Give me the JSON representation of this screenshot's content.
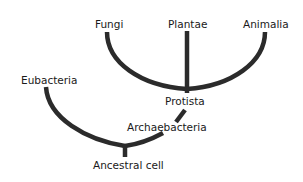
{
  "diagram": {
    "type": "phylogenetic-tree",
    "line_color": "#2b2b2b",
    "text_color": "#1a1a1a",
    "background": "#ffffff",
    "nodes": {
      "fungi": "Fungi",
      "plantae": "Plantae",
      "animalia": "Animalia",
      "eubacteria": "Eubacteria",
      "protista": "Protista",
      "archaebacteria": "Archaebacteria",
      "ancestral_cell": "Ancestral cell"
    },
    "edges": [
      {
        "from": "Ancestral cell",
        "to": "Eubacteria"
      },
      {
        "from": "Ancestral cell",
        "to": "Archaebacteria"
      },
      {
        "from": "Archaebacteria",
        "to": "Protista"
      },
      {
        "from": "Protista",
        "to": "Fungi"
      },
      {
        "from": "Protista",
        "to": "Plantae"
      },
      {
        "from": "Protista",
        "to": "Animalia"
      }
    ]
  }
}
